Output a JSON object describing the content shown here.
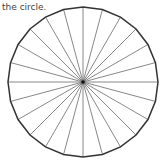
{
  "caption": {
    "visible_line": "the circle."
  },
  "diagram": {
    "type": "circle divided into equal sectors",
    "center": [
      83,
      82
    ],
    "radius": 75,
    "sectors": 24,
    "sector_angle_deg": 15,
    "outline_color": "#333333",
    "spoke_color": "#7a7a7a",
    "center_dot_color": "#111111"
  }
}
